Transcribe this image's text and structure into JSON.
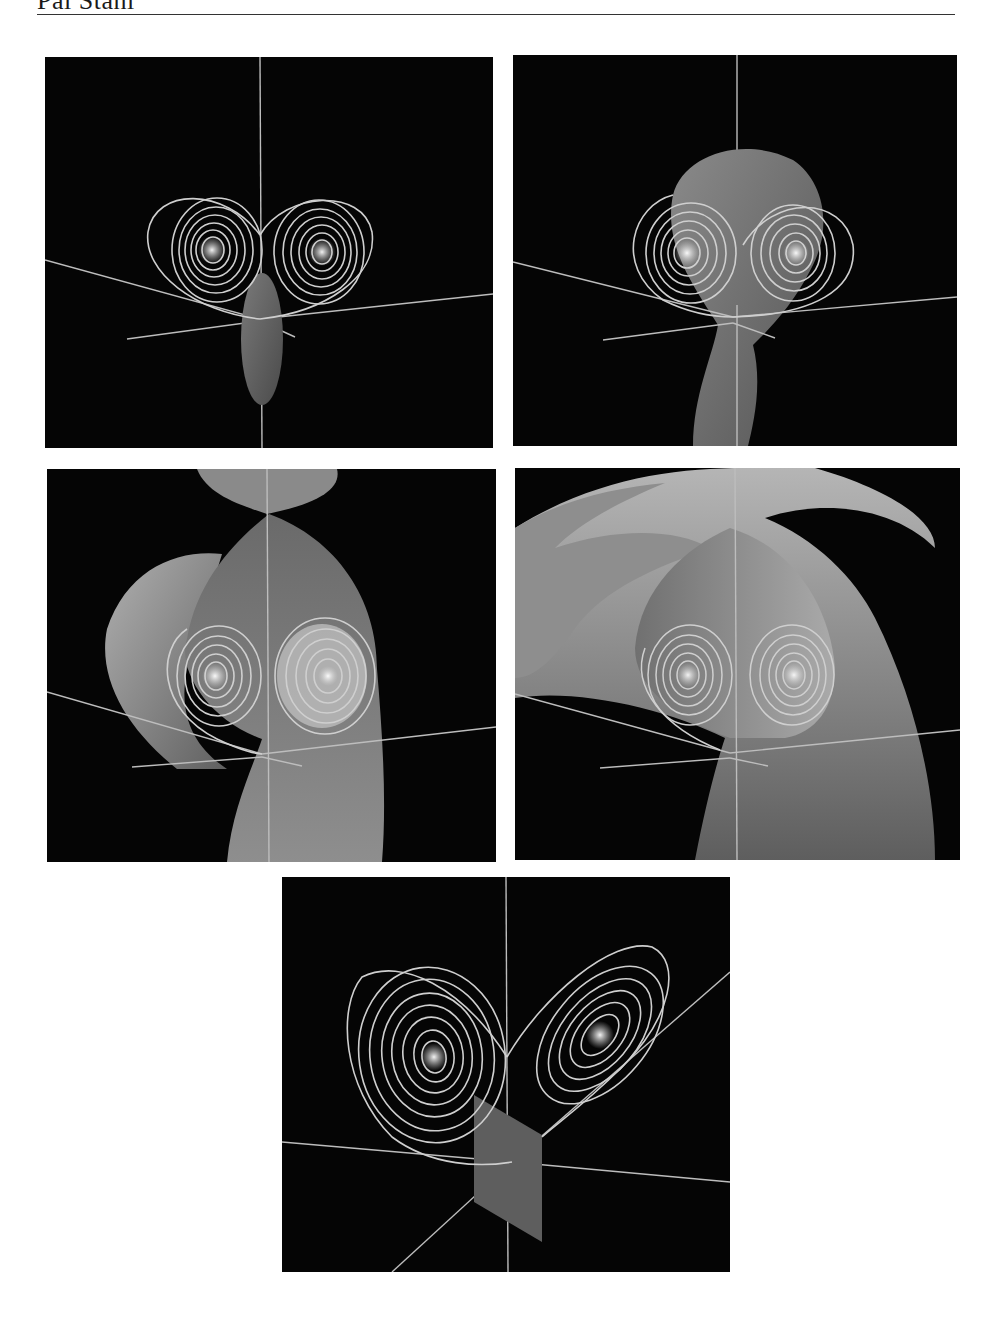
{
  "page": {
    "running_head": "Pål Ståhl",
    "figure": {
      "panel_count": 5,
      "panels": [
        {
          "id": "p1",
          "description": "Lorenz attractor trajectories with two spiral lobes and a small stable manifold sliver at origin"
        },
        {
          "id": "p2",
          "description": "Lorenz trajectories with growing stable manifold surface rising above the lobes"
        },
        {
          "id": "p3",
          "description": "Stable manifold surface folding around both spiral lobes"
        },
        {
          "id": "p4",
          "description": "Larger stable manifold surface wrapping around the attractor"
        },
        {
          "id": "p5",
          "description": "Lorenz attractor from rotated view with a rectangular Poincare section plane"
        }
      ]
    },
    "colors": {
      "panel_background": "#050505",
      "trajectory": "#cfcfcf",
      "axis_line": "#bdbdbd",
      "surface_dark": "#5a5a5a",
      "surface_light": "#a8a8a8",
      "page_background": "#ffffff"
    }
  }
}
